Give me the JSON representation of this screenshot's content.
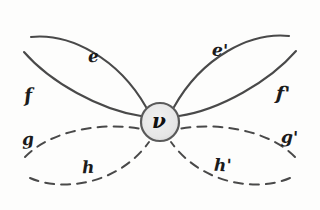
{
  "diagram": {
    "background_color": "#fdfdfc",
    "ink_color": "#4a4a4a",
    "label_color": "#1b1b1b",
    "vertex": {
      "name": "v",
      "label": "ν",
      "center_x": 160,
      "center_y": 122,
      "radius": 19,
      "fill_color": "#e8e8e8",
      "stroke_color": "#5a5a5a"
    },
    "edges": [
      {
        "id": "e",
        "label": "e",
        "style": "solid",
        "position": "upper-left-top",
        "label_x": 88,
        "label_y": 48
      },
      {
        "id": "f",
        "label": "f",
        "style": "solid",
        "position": "upper-left-bottom",
        "label_x": 24,
        "label_y": 86
      },
      {
        "id": "e-prime",
        "label": "e'",
        "style": "solid",
        "position": "upper-right-top",
        "label_x": 212,
        "label_y": 42
      },
      {
        "id": "f-prime",
        "label": "f'",
        "style": "solid",
        "position": "upper-right-bottom",
        "label_x": 276,
        "label_y": 84
      },
      {
        "id": "g",
        "label": "g",
        "style": "dashed",
        "position": "lower-left-top",
        "label_x": 22,
        "label_y": 131
      },
      {
        "id": "h",
        "label": "h",
        "style": "dashed",
        "position": "lower-left-bottom",
        "label_x": 82,
        "label_y": 159
      },
      {
        "id": "g-prime",
        "label": "g'",
        "style": "dashed",
        "position": "lower-right-top",
        "label_x": 281,
        "label_y": 129
      },
      {
        "id": "h-prime",
        "label": "h'",
        "style": "dashed",
        "position": "lower-right-bottom",
        "label_x": 214,
        "label_y": 157
      }
    ]
  }
}
